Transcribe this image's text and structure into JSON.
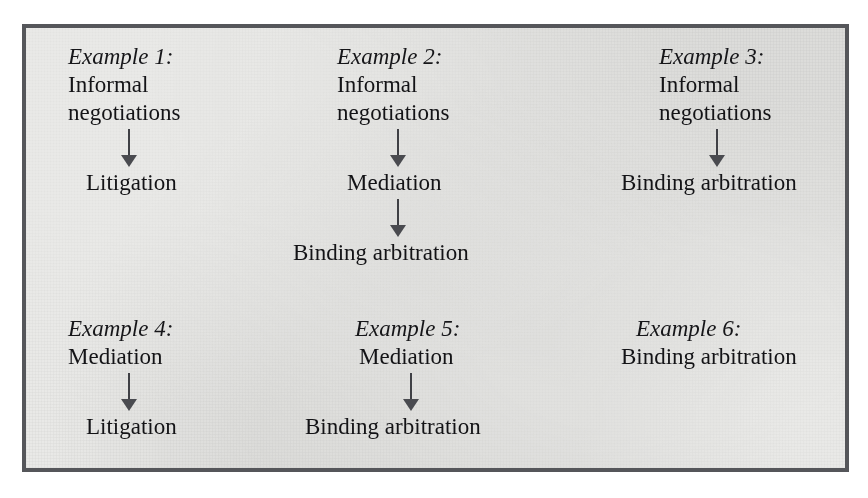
{
  "figure": {
    "kind": "process-flow-diagram",
    "panel_background": "#e9e9e7",
    "border_color": "#55565a",
    "text_color": "#16161a",
    "arrow_color": "#4a4b50",
    "arrow_glyph": "down-arrow",
    "examples": [
      {
        "id": "example-1",
        "label": "Example 1:",
        "steps": [
          "Informal",
          "negotiations",
          "Litigation"
        ],
        "step_blocks": [
          {
            "lines": [
              "Informal",
              "negotiations"
            ]
          },
          {
            "lines": [
              "Litigation"
            ]
          }
        ],
        "arrow_count": 1
      },
      {
        "id": "example-2",
        "label": "Example 2:",
        "steps": [
          "Informal",
          "negotiations",
          "Mediation",
          "Binding arbitration"
        ],
        "step_blocks": [
          {
            "lines": [
              "Informal",
              "negotiations"
            ]
          },
          {
            "lines": [
              "Mediation"
            ]
          },
          {
            "lines": [
              "Binding arbitration"
            ]
          }
        ],
        "arrow_count": 2
      },
      {
        "id": "example-3",
        "label": "Example 3:",
        "steps": [
          "Informal",
          "negotiations",
          "Binding arbitration"
        ],
        "step_blocks": [
          {
            "lines": [
              "Informal",
              "negotiations"
            ]
          },
          {
            "lines": [
              "Binding arbitration"
            ]
          }
        ],
        "arrow_count": 1
      },
      {
        "id": "example-4",
        "label": "Example 4:",
        "steps": [
          "Mediation",
          "Litigation"
        ],
        "step_blocks": [
          {
            "lines": [
              "Mediation"
            ]
          },
          {
            "lines": [
              "Litigation"
            ]
          }
        ],
        "arrow_count": 1
      },
      {
        "id": "example-5",
        "label": "Example 5:",
        "steps": [
          "Mediation",
          "Binding arbitration"
        ],
        "step_blocks": [
          {
            "lines": [
              "Mediation"
            ]
          },
          {
            "lines": [
              "Binding arbitration"
            ]
          }
        ],
        "arrow_count": 1
      },
      {
        "id": "example-6",
        "label": "Example 6:",
        "steps": [
          "Binding arbitration"
        ],
        "step_blocks": [
          {
            "lines": [
              "Binding arbitration"
            ]
          }
        ],
        "arrow_count": 0
      }
    ]
  },
  "ex1": {
    "label": "Example 1:",
    "line1": "Informal",
    "line2": "negotiations",
    "line3": "Litigation"
  },
  "ex2": {
    "label": "Example 2:",
    "line1": "Informal",
    "line2": "negotiations",
    "line3": "Mediation",
    "line4": "Binding arbitration"
  },
  "ex3": {
    "label": "Example 3:",
    "line1": "Informal",
    "line2": "negotiations",
    "line3": "Binding arbitration"
  },
  "ex4": {
    "label": "Example 4:",
    "line1": "Mediation",
    "line2": "Litigation"
  },
  "ex5": {
    "label": "Example 5:",
    "line1": "Mediation",
    "line2": "Binding arbitration"
  },
  "ex6": {
    "label": "Example 6:",
    "line1": "Binding arbitration"
  },
  "page_bleed": {
    "top": "                                                                                                                                                  ",
    "bottom": "                                                                                                                                                  "
  }
}
